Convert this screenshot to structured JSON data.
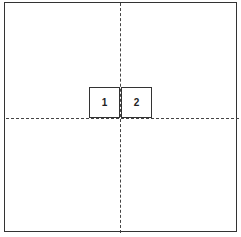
{
  "diagram": {
    "boxes": [
      {
        "label": "1"
      },
      {
        "label": "2"
      }
    ],
    "colors": {
      "line": "#333333",
      "background": "#ffffff"
    }
  }
}
